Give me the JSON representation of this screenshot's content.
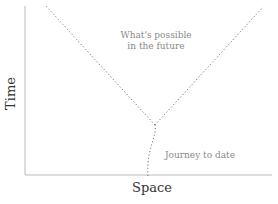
{
  "diagram": {
    "x_axis_label": "Space",
    "y_axis_label": "Time",
    "annotations": {
      "future_line1": "What's possible",
      "future_line2": "in the future",
      "journey": "Journey to date"
    },
    "colors": {
      "axis": "#bbbbbb",
      "dotted": "#777777",
      "annotation_text": "#8a8a8a",
      "axis_title": "#333333"
    }
  }
}
